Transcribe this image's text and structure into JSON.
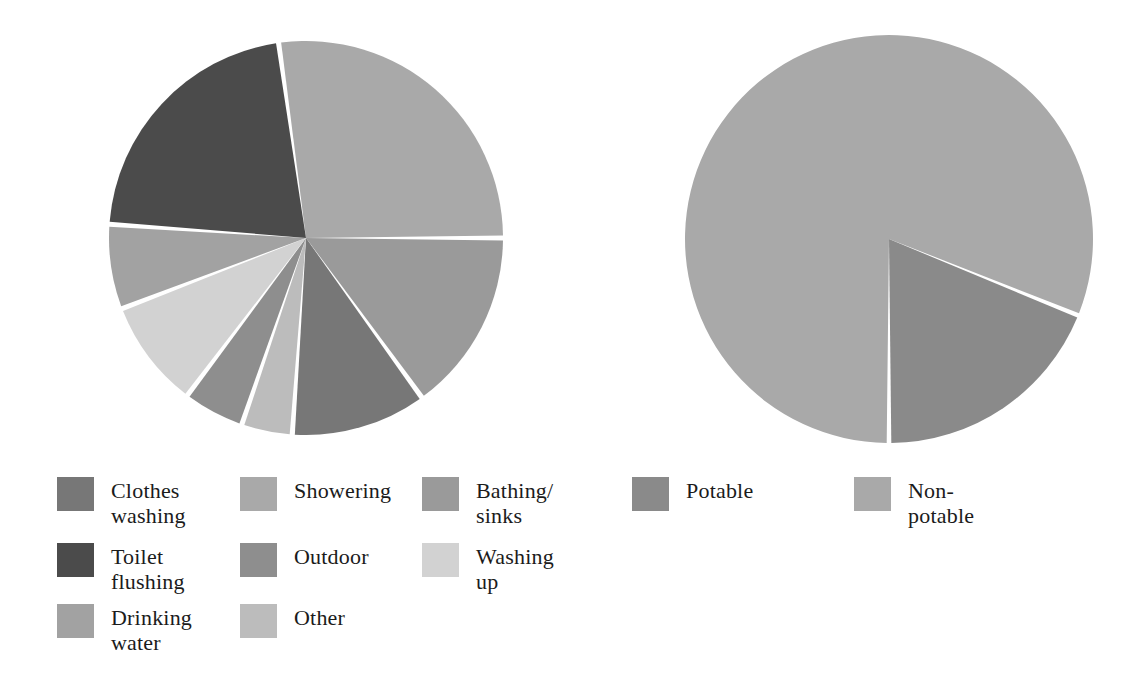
{
  "chart_data": [
    {
      "type": "pie",
      "title": "Domestic water use by activity",
      "id": "water-use-by-activity",
      "legend_position": "bottom-left",
      "categories": [
        "Showering",
        "Bathing/sinks",
        "Clothes washing",
        "Other",
        "Outdoor",
        "Washing up",
        "Drinking water",
        "Toilet flushing"
      ],
      "values": [
        27,
        15,
        11,
        4,
        5,
        9,
        7,
        22
      ],
      "unit": "%",
      "start_angle_deg": -8,
      "direction": "clockwise",
      "colors": [
        "#a9a9a9",
        "#9a9a9a",
        "#777777",
        "#bcbcbc",
        "#8e8e8e",
        "#d2d2d2",
        "#a2a2a2",
        "#4b4b4b"
      ],
      "slices": [
        {
          "label": "Showering",
          "value": 27,
          "color": "#a9a9a9",
          "start_deg": -8,
          "end_deg": 90
        },
        {
          "label": "Bathing/sinks",
          "value": 15,
          "color": "#9a9a9a",
          "start_deg": 90,
          "end_deg": 144
        },
        {
          "label": "Clothes washing",
          "value": 11,
          "color": "#777777",
          "start_deg": 144,
          "end_deg": 184
        },
        {
          "label": "Other",
          "value": 4,
          "color": "#bcbcbc",
          "start_deg": 184,
          "end_deg": 199
        },
        {
          "label": "Outdoor",
          "value": 5,
          "color": "#8e8e8e",
          "start_deg": 199,
          "end_deg": 217
        },
        {
          "label": "Washing up",
          "value": 9,
          "color": "#d2d2d2",
          "start_deg": 217,
          "end_deg": 249
        },
        {
          "label": "Drinking water",
          "value": 7,
          "color": "#a2a2a2",
          "start_deg": 249,
          "end_deg": 274
        },
        {
          "label": "Toilet flushing",
          "value": 22,
          "color": "#4b4b4b",
          "start_deg": 274,
          "end_deg": 352
        }
      ]
    },
    {
      "type": "pie",
      "title": "Potable vs non-potable water use",
      "id": "potable-vs-nonpotable",
      "legend_position": "bottom-right",
      "categories": [
        "Non-potable",
        "Potable"
      ],
      "values": [
        81,
        19
      ],
      "unit": "%",
      "start_angle_deg": 180,
      "direction": "clockwise",
      "colors": [
        "#a9a9a9",
        "#8a8a8a"
      ],
      "slices": [
        {
          "label": "Non-potable",
          "value": 81,
          "color": "#a9a9a9",
          "start_deg": 180,
          "end_deg": 472
        },
        {
          "label": "Potable",
          "value": 19,
          "color": "#8a8a8a",
          "start_deg": 112,
          "end_deg": 180
        }
      ]
    }
  ],
  "left_chart": {
    "center_x": 306,
    "center_y": 238,
    "radius": 197,
    "gap_deg": 1.5
  },
  "right_chart": {
    "center_x": 888,
    "center_y": 238,
    "radius": 204,
    "gap_deg": 1.3
  },
  "legend_left": {
    "columns": [
      {
        "items": [
          {
            "label": "Clothes\nwashing",
            "color": "#777777"
          },
          {
            "label": "Toilet\nflushing",
            "color": "#4b4b4b"
          },
          {
            "label": "Drinking\nwater",
            "color": "#a2a2a2"
          }
        ]
      },
      {
        "items": [
          {
            "label": "Showering",
            "color": "#a9a9a9"
          },
          {
            "label": "Outdoor",
            "color": "#8e8e8e"
          },
          {
            "label": "Other",
            "color": "#bcbcbc"
          }
        ]
      },
      {
        "items": [
          {
            "label": "Bathing/\nsinks",
            "color": "#9a9a9a"
          },
          {
            "label": "Washing\nup",
            "color": "#d2d2d2"
          }
        ]
      }
    ]
  },
  "legend_right": {
    "columns": [
      {
        "items": [
          {
            "label": "Potable",
            "color": "#8a8a8a"
          }
        ]
      },
      {
        "items": [
          {
            "label": "Non-\npotable",
            "color": "#a9a9a9"
          }
        ]
      }
    ]
  },
  "style": {
    "background": "#ffffff",
    "slice_separator": "#ffffff",
    "text_color": "#1b1b1b"
  }
}
